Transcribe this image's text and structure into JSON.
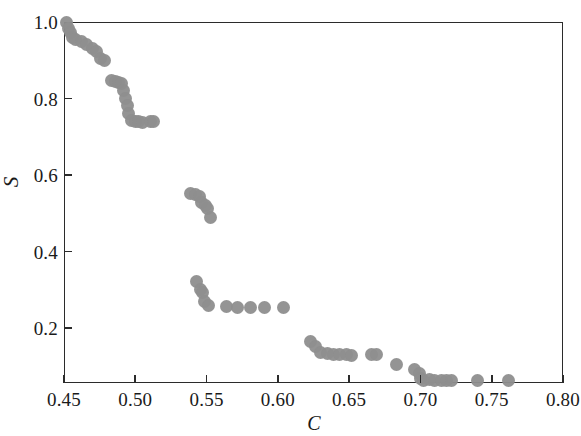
{
  "chart_data": {
    "type": "scatter",
    "title": "",
    "xlabel": "C",
    "ylabel": "S",
    "xlim": [
      0.45,
      0.8
    ],
    "ylim": [
      0.0,
      1.0
    ],
    "grid": false,
    "legend": null,
    "xticks": [
      0.45,
      0.5,
      0.55,
      0.6,
      0.65,
      0.7,
      0.75,
      0.8
    ],
    "xtick_labels": [
      "0.45",
      "0.50",
      "0.55",
      "0.60",
      "0.65",
      "0.70",
      "0.75",
      "0.80"
    ],
    "yticks": [
      0.2,
      0.4,
      0.6,
      0.8,
      1.0
    ],
    "ytick_labels": [
      "0.2",
      "0.4",
      "0.6",
      "0.8",
      "1.0"
    ],
    "marker": {
      "shape": "circle",
      "color": "#8e8e8e",
      "size_px": 13
    },
    "series": [
      {
        "name": "S vs C",
        "points": [
          [
            0.4515,
            1.0
          ],
          [
            0.453,
            0.983
          ],
          [
            0.4545,
            0.972
          ],
          [
            0.456,
            0.96
          ],
          [
            0.458,
            0.955
          ],
          [
            0.462,
            0.95
          ],
          [
            0.4655,
            0.94
          ],
          [
            0.47,
            0.93
          ],
          [
            0.473,
            0.922
          ],
          [
            0.4755,
            0.905
          ],
          [
            0.4785,
            0.9
          ],
          [
            0.483,
            0.848
          ],
          [
            0.486,
            0.845
          ],
          [
            0.488,
            0.842
          ],
          [
            0.49,
            0.84
          ],
          [
            0.492,
            0.82
          ],
          [
            0.493,
            0.8
          ],
          [
            0.4945,
            0.782
          ],
          [
            0.4955,
            0.762
          ],
          [
            0.4975,
            0.742
          ],
          [
            0.5,
            0.74
          ],
          [
            0.5025,
            0.74
          ],
          [
            0.505,
            0.738
          ],
          [
            0.5105,
            0.74
          ],
          [
            0.513,
            0.74
          ],
          [
            0.539,
            0.552
          ],
          [
            0.542,
            0.548
          ],
          [
            0.545,
            0.545
          ],
          [
            0.5465,
            0.528
          ],
          [
            0.549,
            0.52
          ],
          [
            0.551,
            0.512
          ],
          [
            0.5525,
            0.49
          ],
          [
            0.543,
            0.322
          ],
          [
            0.5455,
            0.3
          ],
          [
            0.547,
            0.292
          ],
          [
            0.5485,
            0.27
          ],
          [
            0.5515,
            0.258
          ],
          [
            0.564,
            0.255
          ],
          [
            0.572,
            0.253
          ],
          [
            0.581,
            0.253
          ],
          [
            0.5905,
            0.253
          ],
          [
            0.604,
            0.253
          ],
          [
            0.623,
            0.165
          ],
          [
            0.6265,
            0.152
          ],
          [
            0.63,
            0.135
          ],
          [
            0.635,
            0.133
          ],
          [
            0.639,
            0.132
          ],
          [
            0.643,
            0.13
          ],
          [
            0.648,
            0.13
          ],
          [
            0.652,
            0.128
          ],
          [
            0.6655,
            0.132
          ],
          [
            0.669,
            0.13
          ],
          [
            0.683,
            0.105
          ],
          [
            0.696,
            0.092
          ],
          [
            0.699,
            0.08
          ],
          [
            0.7,
            0.068
          ],
          [
            0.7025,
            0.062
          ],
          [
            0.7065,
            0.065
          ],
          [
            0.71,
            0.063
          ],
          [
            0.7145,
            0.063
          ],
          [
            0.718,
            0.062
          ],
          [
            0.722,
            0.062
          ],
          [
            0.74,
            0.062
          ],
          [
            0.762,
            0.062
          ]
        ]
      }
    ]
  },
  "axes": {
    "frame_color": "#2b2b2b"
  }
}
